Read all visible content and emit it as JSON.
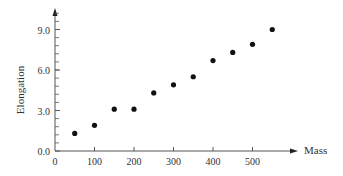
{
  "chart_data": {
    "type": "scatter",
    "title": "",
    "xlabel": "Mass",
    "ylabel": "Elongation",
    "xlim": [
      0,
      580
    ],
    "ylim": [
      0,
      10.5
    ],
    "grid": false,
    "legend": null,
    "x_ticks": [
      0,
      100,
      200,
      300,
      400,
      500
    ],
    "x_tick_labels": [
      "0",
      "100",
      "200",
      "300",
      "400",
      "500"
    ],
    "y_ticks": [
      0.0,
      3.0,
      6.0,
      9.0
    ],
    "y_tick_labels": [
      "0.0",
      "3.0",
      "6.0",
      "9.0"
    ],
    "y_minor_step": 0.6,
    "series": [
      {
        "name": "Elongation vs Mass",
        "color": "#111111",
        "x": [
          50,
          100,
          150,
          200,
          250,
          300,
          350,
          400,
          450,
          500,
          550
        ],
        "y": [
          1.3,
          1.9,
          3.1,
          3.1,
          4.3,
          4.9,
          5.5,
          6.7,
          7.3,
          7.9,
          9.0
        ]
      }
    ]
  },
  "axis_color": "#555555"
}
